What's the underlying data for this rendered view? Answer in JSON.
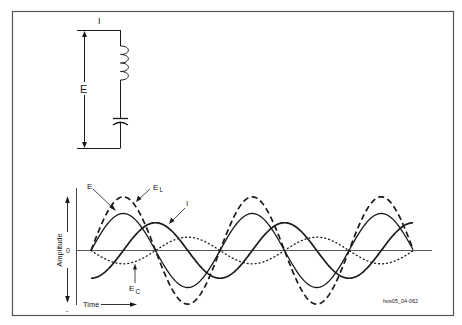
{
  "figure": {
    "id_label": "hos05_04-062",
    "frame_color": "#555555",
    "ink_color": "#1a1a1a"
  },
  "circuit": {
    "current_label": "I",
    "voltage_label": "E",
    "components": [
      "inductor",
      "capacitor"
    ]
  },
  "waveform": {
    "y_axis_label": "Amplitude",
    "zero_label": "0",
    "plus_label": "+",
    "minus_label": "-",
    "x_axis_label": "Time",
    "labels": {
      "E": "E",
      "EL_main": "E",
      "EL_sub": "L",
      "EC_main": "E",
      "EC_sub": "C",
      "I": "I"
    }
  },
  "chart_data": {
    "type": "line",
    "title": "",
    "xlabel": "Time",
    "ylabel": "Amplitude",
    "x_range_cycles": [
      0,
      2.5
    ],
    "series": [
      {
        "name": "E",
        "style": "solid-medium",
        "amplitude": 1.0,
        "phase_deg": 0
      },
      {
        "name": "E_L",
        "style": "dashed",
        "amplitude": 1.45,
        "phase_deg": 0
      },
      {
        "name": "E_C",
        "style": "dotted",
        "amplitude": 0.36,
        "phase_deg": 180
      },
      {
        "name": "I",
        "style": "solid-thick",
        "amplitude": 0.75,
        "phase_deg": -90
      }
    ],
    "annotations": [
      "E",
      "E_L",
      "E_C",
      "I"
    ],
    "grid": false,
    "legend": "inline arrows"
  }
}
